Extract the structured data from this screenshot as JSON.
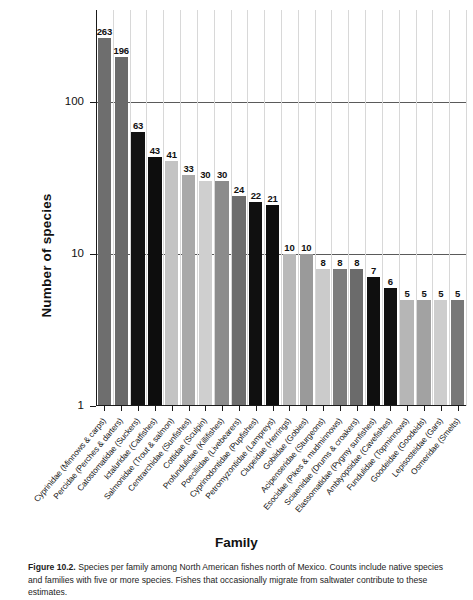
{
  "chart_data": {
    "type": "bar",
    "title": "",
    "xlabel": "Family",
    "ylabel": "Number of species",
    "yscale": "log",
    "ylim": [
      1,
      400
    ],
    "yticks": [
      1,
      10,
      100
    ],
    "ytick_labels": [
      "1",
      "10",
      "100"
    ],
    "grid": "horizontal gridlines at 10 and 100; faint vertical gridlines per category",
    "legend": "none",
    "categories": [
      "Cyprinidae (Minnows & carps)",
      "Percidae (Perches & darters)",
      "Catostomatidae (Suckers)",
      "Ictaluridae (Catfishes)",
      "Salmonidae (Trout & salmon)",
      "Centrarchidae (Sunfishes)",
      "Cottidae (Sculpin)",
      "Profundulidae (Killifishes)",
      "Poeciliidae (Livebearers)",
      "Cyprinodontidae (Pupfishes)",
      "Petromyzontidae (Lampreys)",
      "Clupeidae (Herrings)",
      "Gobiidae (Gobies)",
      "Acipenseridae (Sturgeons)",
      "Esocidae (Pikes & mudminnows)",
      "Sciaenidae (Drums & croakers)",
      "Elassomatidae (Pygmy sunfishes)",
      "Amblyopsidae (Cavefishes)",
      "Fundulidae (Topminnows)",
      "Goodeidae (Goodeids)",
      "Lepisosteidae (Gars)",
      "Osmeridae (Smelts)"
    ],
    "values": [
      263,
      196,
      63,
      43,
      41,
      33,
      30,
      30,
      24,
      22,
      21,
      10,
      10,
      8,
      8,
      8,
      7,
      6,
      5,
      5,
      5,
      5
    ],
    "value_labels": [
      "263",
      "196",
      "63",
      "43",
      "41",
      "33",
      "30",
      "30",
      "24",
      "22",
      "21",
      "10",
      "10",
      "8",
      "8",
      "8",
      "7",
      "6",
      "5",
      "5",
      "5",
      "5"
    ],
    "bar_colors": [
      "#6e6e6e",
      "#6a6a6a",
      "#121212",
      "#0d0d0d",
      "#c3c3c3",
      "#a9a9a9",
      "#cfcfcf",
      "#8c8c8c",
      "#6d6d6d",
      "#101010",
      "#0d0d0d",
      "#b9b9b9",
      "#9a9a9a",
      "#cbcbcb",
      "#7c7c7c",
      "#6b6b6b",
      "#0f0f0f",
      "#101010",
      "#b6b6b6",
      "#a2a2a2",
      "#cdcdcd",
      "#787878"
    ]
  },
  "caption": {
    "figure_number": "Figure 10.2.",
    "text": "Species per family among North American fishes north of Mexico. Counts include native species and families with five or more species. Fishes that occasionally migrate from saltwater contribute to these estimates."
  }
}
